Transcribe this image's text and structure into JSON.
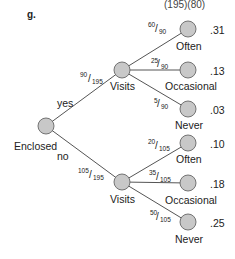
{
  "figure_label": "g.",
  "top_clipped_text": "(195)(80)",
  "root": {
    "label": "Enclosed"
  },
  "branches": [
    {
      "label": "yes",
      "fraction": {
        "num": "90",
        "den": "195"
      },
      "node_label": "Visits",
      "leaves": [
        {
          "label": "Often",
          "fraction": {
            "num": "60",
            "den": "90"
          },
          "prob": ".31"
        },
        {
          "label": "Occasional",
          "fraction": {
            "num": "25",
            "den": "90"
          },
          "prob": ".13"
        },
        {
          "label": "Never",
          "fraction": {
            "num": "5",
            "den": "90"
          },
          "prob": ".03"
        }
      ]
    },
    {
      "label": "no",
      "fraction": {
        "num": "105",
        "den": "195"
      },
      "node_label": "Visits",
      "leaves": [
        {
          "label": "Often",
          "fraction": {
            "num": "20",
            "den": "105"
          },
          "prob": ".10"
        },
        {
          "label": "Occasional",
          "fraction": {
            "num": "35",
            "den": "105"
          },
          "prob": ".18"
        },
        {
          "label": "Never",
          "fraction": {
            "num": "50",
            "den": "105"
          },
          "prob": ".25"
        }
      ]
    }
  ],
  "colors": {
    "node_fill": "#c8c8c8",
    "node_stroke": "#666666",
    "edge": "#555555"
  }
}
